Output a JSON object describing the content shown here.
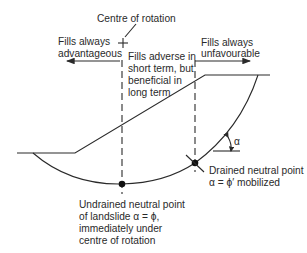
{
  "diagram": {
    "type": "slope-stability-neutral-points",
    "labels": {
      "centre": "Centre of rotation",
      "left_zone": [
        "Fills always",
        "advantageous"
      ],
      "middle_zone": [
        "Fills adverse in",
        "short term, but",
        "beneficial in",
        "long term"
      ],
      "right_zone": [
        "Fills always",
        "unfavourable"
      ],
      "drained_point": [
        "Drained neutral point",
        "α = ϕ′ mobilized"
      ],
      "undrained_point": [
        "Undrained neutral point",
        "of landslide α = ϕ,",
        "immediately under",
        "centre of rotation"
      ],
      "angle": "α"
    },
    "colors": {
      "line": "#2a2a2a",
      "background": "#ffffff"
    }
  }
}
